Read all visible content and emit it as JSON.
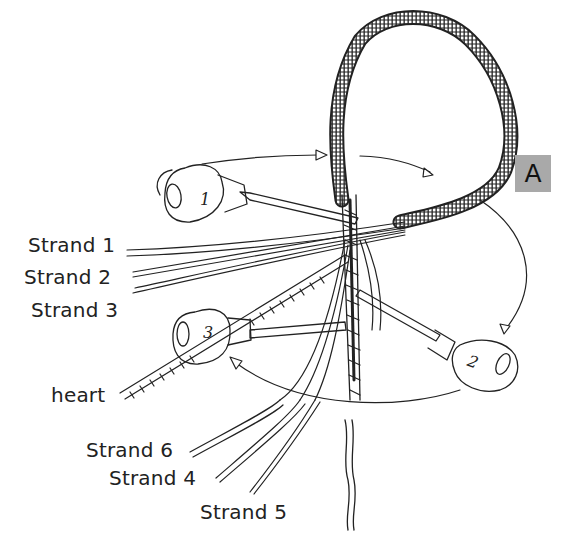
{
  "figure": {
    "badge": "A",
    "labels": {
      "strand1": "Strand 1",
      "strand2": "Strand 2",
      "strand3": "Strand 3",
      "heart": "heart",
      "strand6": "Strand 6",
      "strand4": "Strand 4",
      "strand5": "Strand 5"
    },
    "fids": [
      {
        "number": "1"
      },
      {
        "number": "2"
      },
      {
        "number": "3"
      }
    ],
    "colors": {
      "ink": "#222222",
      "badge_bg": "#a9a9a9",
      "background": "#ffffff"
    }
  }
}
